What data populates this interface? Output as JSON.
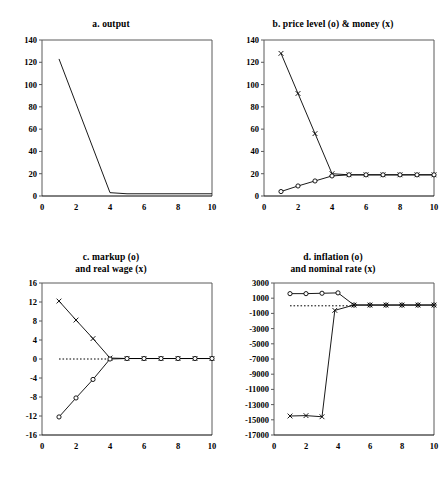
{
  "figure": {
    "panel_count": 4,
    "background_color": "#ffffff",
    "line_color": "#000000"
  },
  "chart_data": [
    {
      "type": "line",
      "panel": "a",
      "title": "a. output",
      "title_lines": [
        "a. output"
      ],
      "xlabel": "",
      "ylabel": "",
      "xlim": [
        0,
        10
      ],
      "ylim": [
        0,
        140
      ],
      "xticks": [
        0,
        2,
        4,
        6,
        8,
        10
      ],
      "yticks": [
        0,
        20,
        40,
        60,
        80,
        100,
        120,
        140
      ],
      "xtick_labels": [
        "0",
        "2",
        "4",
        "6",
        "8",
        "10"
      ],
      "ytick_labels": [
        "0",
        "20",
        "40",
        "60",
        "80",
        "100",
        "120",
        "140"
      ],
      "grid": false,
      "legend": "none",
      "zero_line": false,
      "series": [
        {
          "name": "output",
          "marker": "none",
          "x": [
            1,
            2,
            3,
            4,
            5,
            6,
            7,
            8,
            9,
            10
          ],
          "values": [
            123,
            83,
            43,
            3,
            2,
            2,
            2,
            2,
            2,
            2
          ]
        }
      ]
    },
    {
      "type": "line",
      "panel": "b",
      "title": "b. price level (o) & money (x)",
      "title_lines": [
        "b. price level (o) & money (x)"
      ],
      "xlabel": "",
      "ylabel": "",
      "xlim": [
        0,
        10
      ],
      "ylim": [
        0,
        140
      ],
      "xticks": [
        0,
        2,
        4,
        6,
        8,
        10
      ],
      "yticks": [
        0,
        20,
        40,
        60,
        80,
        100,
        120,
        140
      ],
      "xtick_labels": [
        "0",
        "2",
        "4",
        "6",
        "8",
        "10"
      ],
      "ytick_labels": [
        "0",
        "20",
        "40",
        "60",
        "80",
        "100",
        "120",
        "140"
      ],
      "grid": false,
      "legend": "inline-title",
      "zero_line": false,
      "series": [
        {
          "name": "money (x)",
          "marker": "x",
          "x": [
            1,
            2,
            3,
            4,
            5,
            6,
            7,
            8,
            9,
            10
          ],
          "values": [
            128,
            92,
            56,
            20,
            19,
            19,
            19,
            19,
            19,
            19
          ]
        },
        {
          "name": "price level (o)",
          "marker": "o",
          "x": [
            1,
            2,
            3,
            4,
            5,
            6,
            7,
            8,
            9,
            10
          ],
          "values": [
            4,
            9,
            13.5,
            18,
            19,
            19,
            19,
            19,
            19,
            19
          ]
        }
      ]
    },
    {
      "type": "line",
      "panel": "c",
      "title": "c. markup (o) and real wage (x)",
      "title_lines": [
        "c. markup (o)",
        "and real wage (x)"
      ],
      "xlabel": "",
      "ylabel": "",
      "xlim": [
        0,
        10
      ],
      "ylim": [
        -16,
        16
      ],
      "xticks": [
        0,
        2,
        4,
        6,
        8,
        10
      ],
      "yticks": [
        -16,
        -12,
        -8,
        -4,
        0,
        4,
        8,
        12,
        16
      ],
      "xtick_labels": [
        "0",
        "2",
        "4",
        "6",
        "8",
        "10"
      ],
      "ytick_labels": [
        "-16",
        "-12",
        "-8",
        "-4",
        "0",
        "4",
        "8",
        "12",
        "16"
      ],
      "grid": false,
      "legend": "inline-title",
      "zero_line": true,
      "zero_line_style": "dotted",
      "zero_line_x_range": [
        1,
        4
      ],
      "series": [
        {
          "name": "real wage (x)",
          "marker": "x",
          "x": [
            1,
            2,
            3,
            4,
            5,
            6,
            7,
            8,
            9,
            10
          ],
          "values": [
            12.2,
            8.2,
            4.3,
            0.2,
            0.1,
            0.1,
            0.1,
            0.1,
            0.1,
            0.1
          ]
        },
        {
          "name": "markup (o)",
          "marker": "o",
          "x": [
            1,
            2,
            3,
            4,
            5,
            6,
            7,
            8,
            9,
            10
          ],
          "values": [
            -12.2,
            -8.2,
            -4.3,
            0.0,
            0.1,
            0.1,
            0.1,
            0.1,
            0.1,
            0.1
          ]
        }
      ]
    },
    {
      "type": "line",
      "panel": "d",
      "title": "d. inflation (o) and nominal rate (x)",
      "title_lines": [
        "d. inflation (o)",
        "and nominal rate (x)"
      ],
      "xlabel": "",
      "ylabel": "",
      "xlim": [
        0,
        10
      ],
      "ylim": [
        -17000,
        3000
      ],
      "xticks": [
        0,
        2,
        4,
        6,
        8,
        10
      ],
      "yticks": [
        -17000,
        -15000,
        -13000,
        -11000,
        -9000,
        -7000,
        -5000,
        -3000,
        -1000,
        1000,
        3000
      ],
      "xtick_labels": [
        "0",
        "2",
        "4",
        "6",
        "8",
        "10"
      ],
      "ytick_labels": [
        "-17000",
        "-15000",
        "-13000",
        "-11000",
        "-9000",
        "-7000",
        "-5000",
        "-3000",
        "-1000",
        "1000",
        "3000"
      ],
      "grid": false,
      "legend": "inline-title",
      "zero_line": true,
      "zero_line_style": "dotted",
      "zero_line_x_range": [
        1,
        5
      ],
      "series": [
        {
          "name": "inflation (o)",
          "marker": "o",
          "x": [
            1,
            2,
            3,
            4,
            5,
            6,
            7,
            8,
            9,
            10
          ],
          "values": [
            1600,
            1600,
            1650,
            1700,
            100,
            100,
            100,
            100,
            100,
            100
          ]
        },
        {
          "name": "nominal rate (x)",
          "marker": "x",
          "x": [
            1,
            2,
            3,
            3.8,
            5,
            6,
            7,
            8,
            9,
            10
          ],
          "values": [
            -14500,
            -14450,
            -14600,
            -600,
            100,
            100,
            100,
            100,
            100,
            100
          ]
        }
      ]
    }
  ]
}
